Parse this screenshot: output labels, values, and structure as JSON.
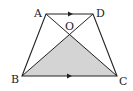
{
  "diagram": {
    "type": "trapezoid",
    "points": {
      "A": {
        "label": "A",
        "x": 46,
        "y": 14
      },
      "D": {
        "label": "D",
        "x": 93,
        "y": 14
      },
      "B": {
        "label": "B",
        "x": 22,
        "y": 76
      },
      "C": {
        "label": "C",
        "x": 117,
        "y": 76
      },
      "O": {
        "label": "O",
        "x": 70,
        "y": 34
      }
    },
    "shaded_region": "triangle OBC",
    "shade_color": "#d4d4d4",
    "line_color": "#222222",
    "parallel_marks": [
      "AD",
      "BC"
    ]
  }
}
